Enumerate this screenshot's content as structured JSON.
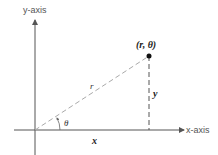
{
  "diagram": {
    "type": "polar-coordinates",
    "axes": {
      "y_label": "y-axis",
      "x_label": "x-axis"
    },
    "point": {
      "label": "(r, θ)"
    },
    "labels": {
      "radius": "r",
      "angle": "θ",
      "x_component": "x",
      "y_component": "y"
    },
    "colors": {
      "axis": "#555555",
      "dashed": "#999999",
      "point": "#111111"
    }
  }
}
